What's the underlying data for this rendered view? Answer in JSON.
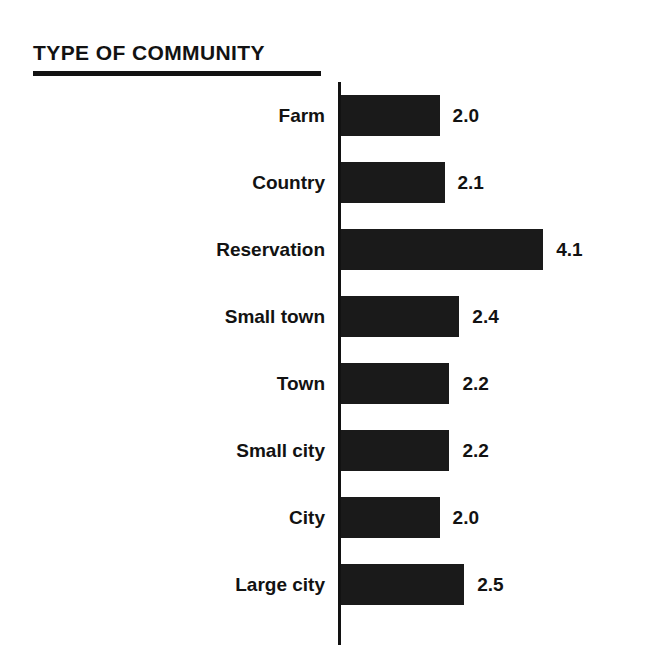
{
  "chart_data": {
    "type": "bar",
    "orientation": "horizontal",
    "title": "TYPE OF COMMUNITY",
    "xlabel": "",
    "ylabel": "",
    "categories": [
      "Farm",
      "Country",
      "Reservation",
      "Small town",
      "Town",
      "Small city",
      "City",
      "Large city"
    ],
    "values": [
      2.0,
      2.1,
      4.1,
      2.4,
      2.2,
      2.2,
      2.0,
      2.5
    ],
    "value_labels": [
      "2.0",
      "2.1",
      "4.1",
      "2.4",
      "2.2",
      "2.2",
      "2.0",
      "2.5"
    ],
    "xlim": [
      0,
      4.1
    ],
    "grid": false,
    "legend": null,
    "bar_color": "#1a1a1a",
    "background_color": "#ffffff",
    "axis_color": "#121212"
  }
}
